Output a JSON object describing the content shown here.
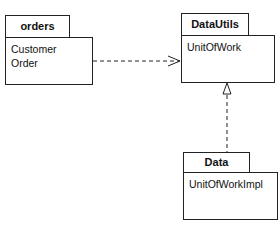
{
  "packages": [
    {
      "name": "orders",
      "classes": [
        "Customer",
        "Order"
      ]
    },
    {
      "name": "DataUtils",
      "classes": [
        "UnitOfWork"
      ]
    },
    {
      "name": "Data Mapper",
      "classes": [
        "UnitOfWorkImpl"
      ]
    }
  ],
  "relationships": [
    {
      "from": "orders",
      "to": "DataUtils",
      "type": "dependency"
    },
    {
      "from": "Data Mapper",
      "to": "DataUtils",
      "type": "realization"
    }
  ]
}
